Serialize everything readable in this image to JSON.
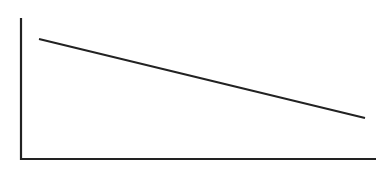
{
  "chart_data": {
    "type": "line",
    "title": "",
    "xlabel": "",
    "ylabel": "",
    "x": [
      0,
      1
    ],
    "series": [
      {
        "name": "",
        "values": [
          0.8,
          0.3
        ],
        "color": "#222222"
      }
    ],
    "xlim": [
      0,
      1
    ],
    "ylim": [
      0,
      1
    ],
    "grid": false,
    "legend": null,
    "tick_labels": false
  },
  "style": {
    "axis_color": "#222222",
    "line_color": "#222222"
  },
  "layout": {
    "y_axis": {
      "x": 21,
      "y1": 18,
      "y2": 159
    },
    "x_axis": {
      "y": 159,
      "x1": 21,
      "x2": 376
    },
    "line": {
      "x1": 39,
      "y1": 39,
      "x2": 365,
      "y2": 118
    }
  }
}
